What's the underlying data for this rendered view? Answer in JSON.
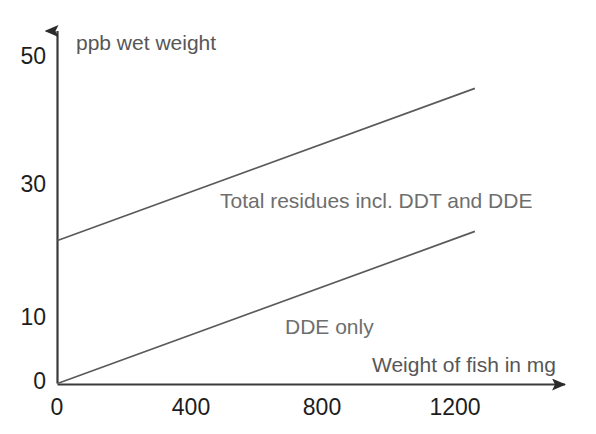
{
  "chart_data": {
    "type": "line",
    "title": "",
    "xlabel": "Weight of fish in mg",
    "ylabel": "ppb wet weight",
    "xlim": [
      0,
      1260
    ],
    "ylim": [
      0,
      52
    ],
    "grid": false,
    "legend_position": "inline-annotation",
    "x_ticks": [
      "0",
      "400",
      "800",
      "1200"
    ],
    "x_tick_values": [
      0,
      400,
      800,
      1200
    ],
    "y_ticks": [
      "0",
      "10",
      "30",
      "50"
    ],
    "y_tick_values": [
      0,
      10,
      30,
      50
    ],
    "axis_arrows": true,
    "series": [
      {
        "name": "Total residues incl. DDT and DDE",
        "label": "Total residues incl. DDT and DDE",
        "color": "#5a5a5a",
        "x": [
          0,
          1260
        ],
        "values": [
          22,
          45.4
        ]
      },
      {
        "name": "DDE only",
        "label": "DDE only",
        "color": "#5a5a5a",
        "x": [
          0,
          1260
        ],
        "values": [
          0,
          23.4
        ]
      }
    ],
    "annotations": [
      {
        "text": "Total residues incl. DDT and DDE",
        "x": 490,
        "y": 30.2
      },
      {
        "text": "DDE only",
        "x": 690,
        "y": 10.7
      }
    ]
  },
  "axes": {
    "y_title": "ppb wet weight",
    "x_title": "Weight of fish in mg",
    "y_tick_labels": [
      "50",
      "30",
      "10",
      "0"
    ],
    "x_tick_labels": [
      "0",
      "400",
      "800",
      "1200"
    ]
  },
  "series_labels": {
    "total": "Total residues incl. DDT and DDE",
    "dde": "DDE only"
  },
  "colors": {
    "line": "#5a5a5a",
    "axis": "#3a3a3a",
    "tick_text": "#1d1d1d",
    "note_text": "#6e6e6e",
    "background": "#ffffff"
  }
}
